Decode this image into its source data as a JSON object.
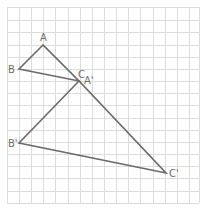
{
  "diagram": {
    "type": "grid-geometry",
    "grid": {
      "x_lines": [
        7,
        19,
        31,
        43,
        55,
        68,
        80,
        92,
        104,
        116,
        128,
        140,
        153,
        165,
        177,
        189,
        199
      ],
      "y_lines": [
        7,
        20,
        32,
        45,
        57,
        69,
        81,
        93,
        105,
        118,
        130,
        142,
        154,
        166,
        178,
        191,
        203
      ],
      "x_min": 7,
      "x_max": 199,
      "y_min": 7,
      "y_max": 203,
      "color": "#dcdcdc"
    },
    "line_color": "#6a6a6a",
    "label_color": "#6e6e6e",
    "points": {
      "A": {
        "x": 43,
        "y": 45
      },
      "B": {
        "x": 19,
        "y": 69
      },
      "C": {
        "x": 79,
        "y": 81
      },
      "A_prime": {
        "x": 79,
        "y": 81
      },
      "B_prime": {
        "x": 19,
        "y": 143
      },
      "C_prime": {
        "x": 166,
        "y": 173
      }
    },
    "triangles": [
      {
        "name": "ABC",
        "vertices": [
          "A",
          "B",
          "C"
        ]
      },
      {
        "name": "A'B'C'",
        "vertices": [
          "A_prime",
          "B_prime",
          "C_prime"
        ]
      }
    ],
    "labels": [
      {
        "id": "A",
        "text": "A",
        "x": 40,
        "y": 41
      },
      {
        "id": "B",
        "text": "B",
        "x": 8,
        "y": 73
      },
      {
        "id": "C",
        "text": "C",
        "x": 78,
        "y": 78
      },
      {
        "id": "A_prime",
        "text": "A'",
        "x": 84,
        "y": 84
      },
      {
        "id": "B_prime",
        "text": "B'",
        "x": 8,
        "y": 147
      },
      {
        "id": "C_prime",
        "text": "C'",
        "x": 169,
        "y": 177
      }
    ]
  }
}
